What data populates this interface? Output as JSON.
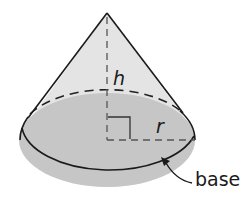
{
  "diagram": {
    "type": "geometric-figure",
    "shape": "cone",
    "labels": {
      "height": "h",
      "radius": "r",
      "base": "base"
    },
    "colors": {
      "side_fill": "#e6e6e6",
      "base_fill": "#c4c4c4",
      "stroke": "#1a1a1a",
      "dashed": "#555555"
    }
  }
}
